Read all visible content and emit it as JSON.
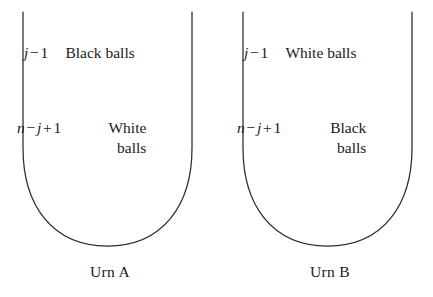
{
  "figure": {
    "background_color": "#ffffff",
    "stroke_color": "#2b2b2b",
    "text_color": "#1a1a1a"
  },
  "urns": [
    {
      "id": "urn-a",
      "caption": "Urn A",
      "top_row": {
        "count_var": "j",
        "count_op": "−",
        "count_num": "1",
        "contents_line1": "Black balls",
        "contents_line2": ""
      },
      "bottom_row": {
        "count_var": "n",
        "count_op1": "−",
        "count_var2": "j",
        "count_op2": "+",
        "count_num": "1",
        "contents_line1": "White",
        "contents_line2": "balls"
      }
    },
    {
      "id": "urn-b",
      "caption": "Urn B",
      "top_row": {
        "count_var": "j",
        "count_op": "−",
        "count_num": "1",
        "contents_line1": "White balls",
        "contents_line2": ""
      },
      "bottom_row": {
        "count_var": "n",
        "count_op1": "−",
        "count_var2": "j",
        "count_op2": "+",
        "count_num": "1",
        "contents_line1": "Black",
        "contents_line2": "balls"
      }
    }
  ]
}
